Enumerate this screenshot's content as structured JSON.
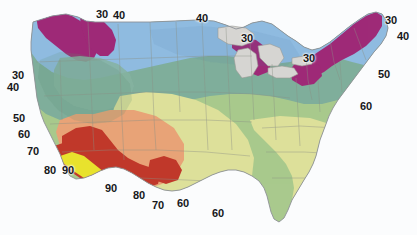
{
  "map": {
    "title": "Contour map of the contiguous United States",
    "background_color": "#fbfcfd",
    "coastline_color": "#8d9196",
    "state_border_color": "#8a8f84",
    "lake_color": "#d6d5d2",
    "lake_border_color": "#9a9a96"
  },
  "legend": {
    "description": "Shaded contour bands labelled with values from 30 to 90",
    "bands": [
      {
        "value": 30,
        "color": "#9e2a77",
        "name": "purple-magenta"
      },
      {
        "value": 40,
        "color": "#8fbbe0",
        "name": "light-blue"
      },
      {
        "value": 50,
        "color": "#7fae9b",
        "name": "blue-green"
      },
      {
        "value": 60,
        "color": "#a8c98c",
        "name": "green"
      },
      {
        "value": 70,
        "color": "#dde09a",
        "name": "yellow-green"
      },
      {
        "value": 80,
        "color": "#e8a377",
        "name": "orange"
      },
      {
        "value": 85,
        "color": "#c0392b",
        "name": "red"
      },
      {
        "value": 90,
        "color": "#e8e22e",
        "name": "yellow"
      }
    ]
  },
  "contour_labels": [
    {
      "text": "30",
      "x": 96,
      "y": 9
    },
    {
      "text": "40",
      "x": 113,
      "y": 10
    },
    {
      "text": "40",
      "x": 196,
      "y": 13
    },
    {
      "text": "30",
      "x": 241,
      "y": 33
    },
    {
      "text": "30",
      "x": 303,
      "y": 53
    },
    {
      "text": "30",
      "x": 385,
      "y": 15
    },
    {
      "text": "40",
      "x": 397,
      "y": 31
    },
    {
      "text": "50",
      "x": 378,
      "y": 69
    },
    {
      "text": "60",
      "x": 360,
      "y": 101
    },
    {
      "text": "30",
      "x": 12,
      "y": 70
    },
    {
      "text": "40",
      "x": 7,
      "y": 82
    },
    {
      "text": "50",
      "x": 13,
      "y": 113
    },
    {
      "text": "60",
      "x": 18,
      "y": 129
    },
    {
      "text": "70",
      "x": 27,
      "y": 146
    },
    {
      "text": "80",
      "x": 44,
      "y": 165
    },
    {
      "text": "90",
      "x": 62,
      "y": 165
    },
    {
      "text": "90",
      "x": 105,
      "y": 183
    },
    {
      "text": "80",
      "x": 133,
      "y": 190
    },
    {
      "text": "70",
      "x": 152,
      "y": 200
    },
    {
      "text": "60",
      "x": 177,
      "y": 198
    },
    {
      "text": "60",
      "x": 212,
      "y": 208
    }
  ]
}
